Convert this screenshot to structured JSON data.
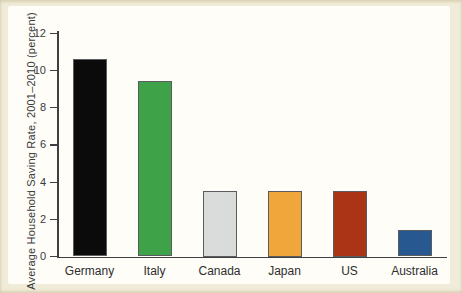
{
  "figure": {
    "background": "#f1ecda",
    "panel_background": "#fefdf8"
  },
  "chart_data": {
    "type": "bar",
    "categories": [
      "Germany",
      "Italy",
      "Canada",
      "Japan",
      "US",
      "Australia"
    ],
    "values": [
      10.6,
      9.4,
      3.5,
      3.5,
      3.5,
      1.4
    ],
    "bar_colors": [
      "#0b0b0c",
      "#3ea348",
      "#d9dcda",
      "#f0a63a",
      "#ac3416",
      "#27588f"
    ],
    "title": "",
    "xlabel": "",
    "ylabel": "Average Household Saving Rate, 2001–2010 (percent)",
    "ylim": [
      0,
      12
    ],
    "yticks": [
      0,
      2,
      4,
      6,
      8,
      10,
      12
    ],
    "grid": false,
    "legend": "none",
    "axis_color": "#3f4042",
    "bar_border_color": "#5b5c60"
  }
}
